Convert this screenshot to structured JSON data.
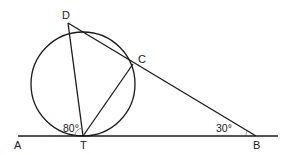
{
  "diagram": {
    "type": "geometry",
    "colors": {
      "stroke": "#1a1a1a",
      "background": "#ffffff"
    },
    "points": {
      "A": {
        "label": "A",
        "x": 18,
        "y": 136
      },
      "T": {
        "label": "T",
        "x": 83,
        "y": 136
      },
      "B": {
        "label": "B",
        "x": 256,
        "y": 136
      },
      "D": {
        "label": "D",
        "x": 68,
        "y": 23
      },
      "C": {
        "label": "C",
        "x": 133,
        "y": 64
      }
    },
    "circle": {
      "cx": 83,
      "cy": 84,
      "r": 52
    },
    "angles": {
      "at_T": {
        "label": "80°",
        "vertex": "T",
        "between": [
          "A",
          "D"
        ]
      },
      "at_B": {
        "label": "30°",
        "vertex": "B",
        "between": [
          "T",
          "C"
        ]
      }
    },
    "segments": [
      [
        "A",
        "B"
      ],
      [
        "D",
        "T"
      ],
      [
        "T",
        "C"
      ],
      [
        "D",
        "B"
      ]
    ]
  }
}
